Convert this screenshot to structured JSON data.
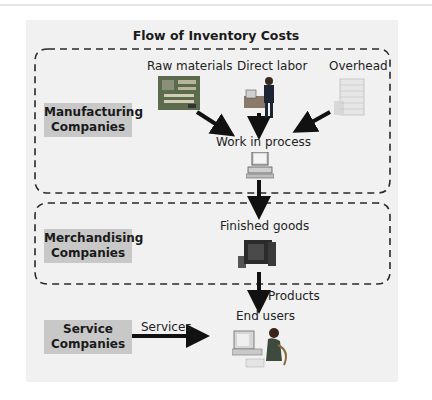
{
  "title": "Flow of Inventory Costs",
  "groups": {
    "manufacturing": {
      "label_line1": "Manufacturing",
      "label_line2": "Companies"
    },
    "merchandising": {
      "label_line1": "Merchandising",
      "label_line2": "Companies"
    },
    "service": {
      "label_line1": "Service",
      "label_line2": "Companies"
    }
  },
  "nodes": {
    "raw_materials": "Raw materials",
    "direct_labor": "Direct labor",
    "overhead": "Overhead",
    "work_in_process": "Work in process",
    "finished_goods": "Finished goods",
    "end_users": "End users"
  },
  "edge_labels": {
    "products": "Products",
    "services": "Services"
  },
  "icons": {
    "raw_materials": "circuit-board-icon",
    "direct_labor": "worker-icon",
    "overhead": "office-building-icon",
    "work_in_process": "computer-icon",
    "finished_goods": "monitor-icon",
    "end_users": "person-at-computer-icon"
  },
  "colors": {
    "panel_bg": "#f1f1f1",
    "label_box_bg": "#c8c8c8",
    "arrow": "#111111",
    "dashed_border": "#2a2a2a"
  }
}
